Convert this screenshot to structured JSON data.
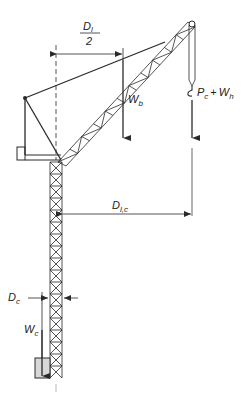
{
  "caption": "Crane loading schematic",
  "labels": {
    "jib_half_length": {
      "num": "D",
      "num_sub": "l",
      "den": "2"
    },
    "jib_weight": {
      "main": "W",
      "sub": "b"
    },
    "load": {
      "p": "P",
      "p_sub": "c",
      "plus": "+",
      "w": "W",
      "w_sub": "h"
    },
    "load_radius": {
      "main": "D",
      "sub": "l,c"
    },
    "mast_width": {
      "main": "D",
      "sub": "c"
    },
    "counterweight": {
      "main": "W",
      "sub": "c"
    }
  },
  "colors": {
    "line": "#2a2a2a",
    "counterweight_fill": "#d8d8d8",
    "background": "#ffffff"
  }
}
